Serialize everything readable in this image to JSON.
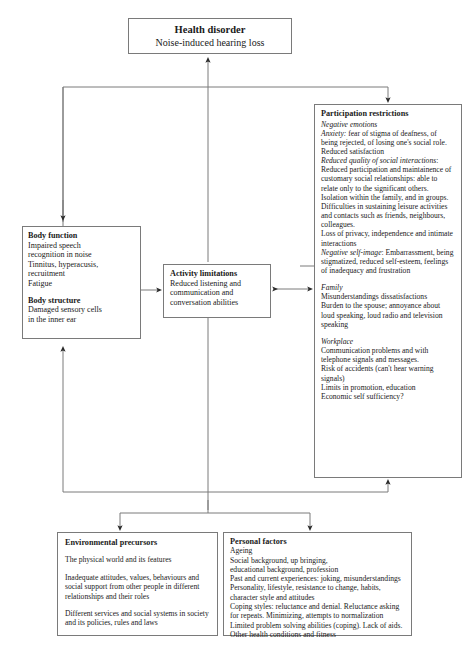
{
  "diagram": {
    "health_disorder": {
      "title": "Health disorder",
      "subtitle": "Noise-induced hearing loss"
    },
    "body": {
      "function_title": "Body function",
      "function_lines": [
        "Impaired speech",
        "recognition in noise",
        "Tinnitus, hyperacusis,",
        "recruitment",
        "Fatigue"
      ],
      "structure_title": "Body structure",
      "structure_lines": [
        "Damaged sensory cells",
        "in the inner ear"
      ]
    },
    "activity": {
      "title": "Activity limitations",
      "lines": [
        "Reduced listening and",
        "communication and",
        "conversation abilities"
      ]
    },
    "participation": {
      "title": "Participation restrictions",
      "negative_emotions_heading": "Negative emotions",
      "anxiety_label": "Anxiety:",
      "anxiety_text": " fear of stigma of deafness, of being rejected, of losing one's social role. Reduced satisfaction",
      "reduced_quality_label": "Reduced quality of social interactions",
      "reduced_quality_text": ": Reduced participation and maintainence of customary social relationships: able to relate only to the significant others. Isolation within the family, and in groups. Difficulties in sustaining leisure activities and contacts such as friends, neighbours, colleagues.",
      "privacy_text": "Loss of privacy, independence and intimate interactions",
      "self_image_label": "Negative self-image",
      "self_image_text": ": Embarrassment, being stigmatized, reduced self-esteem, feelings of inadequacy and frustration",
      "family_heading": "Family",
      "family_lines": [
        "Misunderstandings dissatisfactions",
        "Burden to the spouse; annoyance about loud speaking, loud radio and television speaking"
      ],
      "workplace_heading": "Workplace",
      "workplace_lines": [
        "Communication problems and with telephone signals and messages.",
        "Risk of accidents (can't hear warning signals)",
        "Limits in promotion, education",
        "Economic self sufficiency?"
      ]
    },
    "environmental": {
      "title": "Environmental precursors",
      "paragraphs": [
        "The physical world and its features",
        "Inadequate attitudes, values, behaviours and social support from other people in different relationships and their roles",
        "Different services and social systems in society and its policies, rules and laws"
      ]
    },
    "personal": {
      "title": "Personal factors",
      "lines": [
        "Ageing",
        "Social background, up bringing,",
        "educational background, profession",
        "Past and current experiences: joking, misunderstandings",
        "Personality, lifestyle, resistance to change, habits,",
        "character style and attitudes",
        "Coping styles: reluctance and denial. Reluctance asking",
        "for repeats. Minimizing, attempts to normalization",
        "Limited problem solving abilities (coping). Lack of aids.",
        "Other health conditions and fitness"
      ]
    },
    "colors": {
      "line": "#7a7a7a",
      "text": "#1a1a1a",
      "background": "#ffffff"
    }
  }
}
